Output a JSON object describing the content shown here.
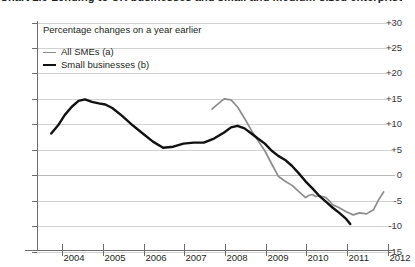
{
  "figure": {
    "title_clipped": "Chart 2.9 Lending to UK businesses and small and medium-sized enterprises (a)",
    "panel_title": "Percentage changes on a year earlier"
  },
  "legend": {
    "position": "top-left",
    "items": [
      {
        "label": "All SMEs (a)",
        "color": "#8c8c8c",
        "style": "thin"
      },
      {
        "label": "Small businesses (b)",
        "color": "#111111",
        "style": "thick"
      }
    ]
  },
  "axes": {
    "y_ticks": [
      "+30",
      "+25",
      "+20",
      "+15",
      "+10",
      "+5",
      "0",
      "-5",
      "-10",
      "-15"
    ],
    "x_ticks": [
      "2004",
      "2005",
      "2006",
      "2007",
      "2008",
      "2009",
      "2010",
      "2011",
      "2012"
    ]
  },
  "chart_data": {
    "type": "line",
    "title": "Chart 2.9 Lending to UK businesses and small and medium-sized enterprises (a)",
    "subtitle": "Percentage changes on a year earlier",
    "xlabel": "",
    "ylabel": "",
    "xlim": [
      2003.4,
      2012.2
    ],
    "ylim": [
      -15,
      30
    ],
    "yticks": [
      -15,
      -10,
      -5,
      0,
      5,
      10,
      15,
      20,
      25,
      30
    ],
    "xticks": [
      2004,
      2005,
      2006,
      2007,
      2008,
      2009,
      2010,
      2011,
      2012
    ],
    "grid": "horizontal",
    "legend_position": "top-left",
    "series": [
      {
        "name": "All SMEs (a)",
        "color": "#8c8c8c",
        "x": [
          2007.7,
          2007.85,
          2008.0,
          2008.17,
          2008.33,
          2008.5,
          2008.67,
          2008.83,
          2009.0,
          2009.17,
          2009.33,
          2009.5,
          2009.67,
          2009.83,
          2010.0,
          2010.08,
          2010.17,
          2010.25,
          2010.33,
          2010.42,
          2010.5,
          2010.58,
          2010.67,
          2010.83,
          2011.0,
          2011.17,
          2011.33,
          2011.5,
          2011.67,
          2011.8,
          2011.92
        ],
        "y": [
          12.8,
          13.8,
          14.8,
          14.6,
          13.2,
          11.0,
          8.6,
          6.6,
          4.6,
          2.0,
          -0.4,
          -1.4,
          -2.2,
          -3.4,
          -4.6,
          -4.2,
          -4.0,
          -4.4,
          -4.2,
          -4.4,
          -4.6,
          -5.2,
          -6.0,
          -6.6,
          -7.4,
          -8.0,
          -7.6,
          -7.8,
          -7.0,
          -5.0,
          -3.5
        ]
      },
      {
        "name": "Small businesses (b)",
        "color": "#111111",
        "x": [
          2003.75,
          2003.92,
          2004.08,
          2004.25,
          2004.42,
          2004.58,
          2004.75,
          2004.92,
          2005.08,
          2005.25,
          2005.5,
          2005.75,
          2006.0,
          2006.25,
          2006.5,
          2006.75,
          2007.0,
          2007.25,
          2007.5,
          2007.75,
          2008.0,
          2008.17,
          2008.33,
          2008.5,
          2008.67,
          2008.83,
          2009.0,
          2009.17,
          2009.33,
          2009.5,
          2009.67,
          2009.83,
          2010.0,
          2010.17,
          2010.33,
          2010.5,
          2010.67,
          2010.83,
          2011.0,
          2011.1
        ],
        "y": [
          8.0,
          9.6,
          11.6,
          13.2,
          14.4,
          14.7,
          14.2,
          13.9,
          13.7,
          13.0,
          11.4,
          9.6,
          8.0,
          6.4,
          5.2,
          5.4,
          6.0,
          6.2,
          6.2,
          7.0,
          8.2,
          9.2,
          9.5,
          9.0,
          8.0,
          7.0,
          6.0,
          4.6,
          3.6,
          2.8,
          1.6,
          0.2,
          -1.4,
          -2.8,
          -4.2,
          -5.4,
          -6.6,
          -7.6,
          -8.8,
          -9.8
        ]
      }
    ]
  }
}
